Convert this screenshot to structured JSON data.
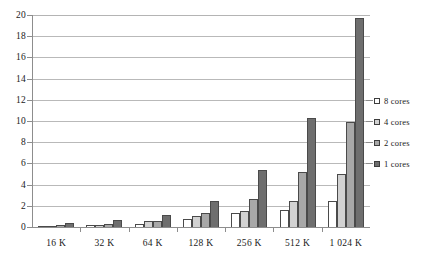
{
  "chart_data": {
    "type": "bar",
    "title": "",
    "subtitle": "",
    "xlabel": "",
    "ylabel": "",
    "categories": [
      "16 K",
      "32 K",
      "64 K",
      "128 K",
      "256 K",
      "512 K",
      "1 024 K"
    ],
    "series": [
      {
        "name": "8 cores",
        "color": "#ffffff",
        "values": [
          0.08,
          0.15,
          0.25,
          0.75,
          1.3,
          1.6,
          2.5
        ]
      },
      {
        "name": "4 cores",
        "color": "#d2d2d2",
        "values": [
          0.1,
          0.22,
          0.6,
          1.05,
          1.5,
          2.5,
          5.0
        ]
      },
      {
        "name": "2 cores",
        "color": "#a8a8a8",
        "values": [
          0.2,
          0.3,
          0.6,
          1.3,
          2.6,
          5.2,
          9.9
        ]
      },
      {
        "name": "1 cores",
        "color": "#6e6e6e",
        "values": [
          0.35,
          0.65,
          1.1,
          2.5,
          5.4,
          10.3,
          19.7
        ]
      }
    ],
    "ylim": [
      0,
      20
    ],
    "yticks": [
      0,
      2,
      4,
      6,
      8,
      10,
      12,
      14,
      16,
      18,
      20
    ],
    "ytick_labels": [
      "0",
      "2",
      "4",
      "6",
      "8",
      "10",
      "12",
      "14",
      "16",
      "18",
      "20"
    ],
    "grid": true,
    "grid_axis": "y",
    "legend_position": "right",
    "background": "#ffffff",
    "axis_color": "#8d8d8d",
    "grid_color": "#b9b9b9",
    "bar_outline_color": "#4a4a4a"
  }
}
